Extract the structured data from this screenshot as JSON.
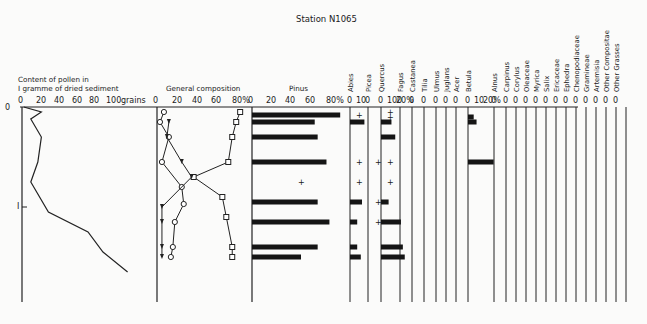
{
  "title": "Station N1065",
  "panels": {
    "pollen_content": {
      "label_line1": "Content of pollen in",
      "label_line2": "I gramme of dried sediment",
      "ticks": [
        "0",
        "20",
        "40",
        "60",
        "80",
        "100",
        "grains"
      ]
    },
    "general_composition": {
      "label": "General composition",
      "ticks": [
        "0",
        "20",
        "40",
        "60",
        "80%"
      ]
    },
    "pinus": {
      "label": "Pinus",
      "ticks": [
        "0",
        "20",
        "40",
        "60",
        "80%"
      ]
    },
    "depth_axis": {
      "ticks": [
        "0",
        "I"
      ]
    }
  },
  "taxa": [
    {
      "name": "Abies",
      "ticks": [
        "0",
        "10"
      ]
    },
    {
      "name": "Picea",
      "ticks": [
        "0"
      ]
    },
    {
      "name": "Quercus",
      "ticks": [
        "0",
        "10",
        "20%"
      ]
    },
    {
      "name": "Fagus",
      "ticks": [
        "0"
      ]
    },
    {
      "name": "Castanea",
      "ticks": [
        "0"
      ]
    },
    {
      "name": "Tilia",
      "ticks": [
        "0"
      ]
    },
    {
      "name": "Ulmus",
      "ticks": [
        "0"
      ]
    },
    {
      "name": "Juglans",
      "ticks": [
        "0"
      ]
    },
    {
      "name": "Acer",
      "ticks": [
        "0"
      ]
    },
    {
      "name": "Betula",
      "ticks": [
        "0",
        "10",
        "20%"
      ]
    },
    {
      "name": "Alnus",
      "ticks": [
        "0"
      ]
    },
    {
      "name": "Carpinus",
      "ticks": [
        "0"
      ]
    },
    {
      "name": "Corylus",
      "ticks": [
        "0"
      ]
    },
    {
      "name": "Oleaceae",
      "ticks": [
        "0"
      ]
    },
    {
      "name": "Myrica",
      "ticks": [
        "0"
      ]
    },
    {
      "name": "Salix",
      "ticks": [
        "0"
      ]
    },
    {
      "name": "Ericaceae",
      "ticks": [
        "0"
      ]
    },
    {
      "name": "Ephedra",
      "ticks": [
        "0"
      ]
    },
    {
      "name": "Chenopodiaceae",
      "ticks": [
        "0"
      ]
    },
    {
      "name": "Gramineae",
      "ticks": [
        "0"
      ]
    },
    {
      "name": "Artemisia",
      "ticks": [
        "0"
      ]
    },
    {
      "name": "Other Compositae",
      "ticks": [
        "0"
      ]
    },
    {
      "name": "Other Grasses",
      "ticks": [
        "0"
      ]
    }
  ],
  "chart_data": {
    "type": "pollen_diagram",
    "title": "Station N1065",
    "depth_axis": {
      "label": "depth (m)",
      "ticks": [
        0,
        1
      ],
      "range": [
        0,
        1.75
      ]
    },
    "samples_depth_m": [
      0.08,
      0.15,
      0.3,
      0.55,
      0.7,
      0.97,
      1.15,
      1.4,
      1.5
    ],
    "pollen_content_curve": {
      "xlabel": "Content of pollen in I gramme of dried sediment",
      "x_unit": "grains",
      "xlim": [
        0,
        100
      ],
      "points": [
        [
          0,
          2
        ],
        [
          0.05,
          22
        ],
        [
          0.12,
          10
        ],
        [
          0.3,
          22
        ],
        [
          0.55,
          18
        ],
        [
          0.75,
          10
        ],
        [
          1.05,
          30
        ],
        [
          1.25,
          75
        ],
        [
          1.45,
          92
        ],
        [
          1.65,
          120
        ]
      ]
    },
    "general_composition": {
      "xlabel": "General composition",
      "xlim": [
        0,
        80
      ],
      "unit": "%",
      "series": [
        {
          "name": "trees (squares)",
          "values": [
            [
              0.05,
              84
            ],
            [
              0.15,
              80
            ],
            [
              0.3,
              76
            ],
            [
              0.55,
              72
            ],
            [
              0.7,
              37
            ],
            [
              0.9,
              66
            ],
            [
              1.1,
              70
            ],
            [
              1.4,
              76
            ],
            [
              1.5,
              76
            ]
          ]
        },
        {
          "name": "shrubs/herbs (circles)",
          "values": [
            [
              0.05,
              7
            ],
            [
              0.15,
              3
            ],
            [
              0.3,
              12
            ],
            [
              0.55,
              5
            ],
            [
              0.8,
              25
            ],
            [
              0.97,
              27
            ],
            [
              1.15,
              18
            ],
            [
              1.4,
              16
            ],
            [
              1.5,
              14
            ]
          ]
        },
        {
          "name": "spores (arrows)",
          "values": [
            [
              0.15,
              12
            ],
            [
              0.3,
              10
            ],
            [
              0.55,
              25
            ],
            [
              0.7,
              35
            ],
            [
              1.0,
              5
            ],
            [
              1.15,
              5
            ],
            [
              1.4,
              5
            ],
            [
              1.5,
              5
            ]
          ]
        }
      ]
    },
    "pinus_percent": {
      "xlim": [
        0,
        80
      ],
      "values": [
        [
          0.08,
          90
        ],
        [
          0.15,
          64
        ],
        [
          0.3,
          67
        ],
        [
          0.55,
          76
        ],
        [
          0.75,
          "+"
        ],
        [
          0.95,
          67
        ],
        [
          1.15,
          79
        ],
        [
          1.4,
          67
        ],
        [
          1.5,
          50
        ]
      ]
    },
    "abies_percent": [
      [
        0.08,
        "+"
      ],
      [
        0.15,
        12
      ],
      [
        0.55,
        "+"
      ],
      [
        0.75,
        "+"
      ],
      [
        0.95,
        10
      ],
      [
        1.15,
        6
      ],
      [
        1.4,
        6
      ],
      [
        1.5,
        9
      ]
    ],
    "picea_percent": [
      [
        0.55,
        "+"
      ],
      [
        0.95,
        "+"
      ],
      [
        1.15,
        "+"
      ]
    ],
    "quercus_percent": [
      [
        0.05,
        "+"
      ],
      [
        0.1,
        "+"
      ],
      [
        0.15,
        11
      ],
      [
        0.3,
        15
      ],
      [
        0.55,
        "+"
      ],
      [
        0.75,
        "+"
      ],
      [
        0.95,
        8
      ],
      [
        1.15,
        21
      ],
      [
        1.4,
        23
      ],
      [
        1.5,
        25
      ]
    ],
    "betula_percent": [
      [
        0.1,
        6
      ],
      [
        0.15,
        9
      ],
      [
        0.55,
        27
      ]
    ],
    "ylabel": "depth",
    "legend": []
  }
}
